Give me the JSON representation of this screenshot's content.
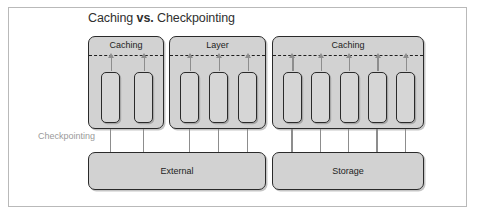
{
  "figure": {
    "title_lead": "Caching ",
    "title_strong": "vs.",
    "title_tail": " Checkpointing",
    "side_label": "Checkpointing"
  },
  "diagram_data": {
    "type": "block-diagram",
    "groups": [
      {
        "label": "Caching",
        "cells": 2,
        "x": 88,
        "width": 76,
        "up_arrows": 2,
        "down_arrows": 2,
        "sink": "External"
      },
      {
        "label": "Layer",
        "cells": 3,
        "x": 169,
        "width": 97,
        "up_arrows": 3,
        "down_arrows": 3,
        "sink": "External"
      },
      {
        "label": "Caching",
        "cells": 5,
        "x": 272,
        "width": 152,
        "up_arrows": 5,
        "down_arrows": 5,
        "sink": "Storage"
      }
    ],
    "sinks": [
      {
        "label": "External",
        "x": 88,
        "width": 178,
        "incoming_arrows": 5
      },
      {
        "label": "Storage",
        "x": 272,
        "width": 152,
        "incoming_arrows": 5
      }
    ],
    "colors": {
      "group_fill": "#d2d2d2",
      "cell_fill": "#d6d6d6",
      "stroke": "#2a2a2a",
      "arrow": "#8d8d8d",
      "frame": "#b9b9b9",
      "title_text": "#2f2f2f",
      "side_label_text": "#9a9a9a"
    }
  }
}
